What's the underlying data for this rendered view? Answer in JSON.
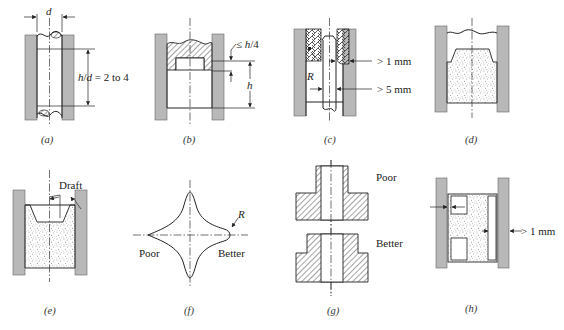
{
  "figure": {
    "panels": [
      {
        "id": "a",
        "caption": "(a)",
        "labels": {
          "diameter": "d",
          "ratio": "h/d = 2 to 4"
        }
      },
      {
        "id": "b",
        "caption": "(b)",
        "labels": {
          "recess": "≤ h/4",
          "height": "h"
        }
      },
      {
        "id": "c",
        "caption": "(c)",
        "labels": {
          "radius": "R",
          "clearance_top": "> 1 mm",
          "clearance_bottom": "> 5 mm"
        }
      },
      {
        "id": "d",
        "caption": "(d)",
        "labels": {}
      },
      {
        "id": "e",
        "caption": "(e)",
        "labels": {
          "draft": "Draft"
        }
      },
      {
        "id": "f",
        "caption": "(f)",
        "labels": {
          "radius": "R",
          "poor": "Poor",
          "better": "Better"
        }
      },
      {
        "id": "g",
        "caption": "(g)",
        "labels": {
          "poor": "Poor",
          "better": "Better"
        }
      },
      {
        "id": "h",
        "caption": "(h)",
        "labels": {
          "clearance": "> 1 mm"
        }
      }
    ]
  },
  "colors": {
    "wall": "#b8b8b8",
    "line": "#222222",
    "stipple": "#555555",
    "background": "#ffffff"
  }
}
